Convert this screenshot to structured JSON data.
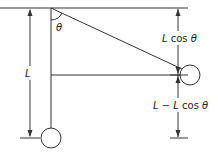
{
  "diagram": {
    "type": "pendulum-geometry",
    "labels": {
      "theta": "θ",
      "length": "L",
      "vertical_component": "L cos θ",
      "rise_height": "L − L cos θ"
    },
    "colors": {
      "line": "#333333",
      "background": "#ffffff"
    }
  }
}
